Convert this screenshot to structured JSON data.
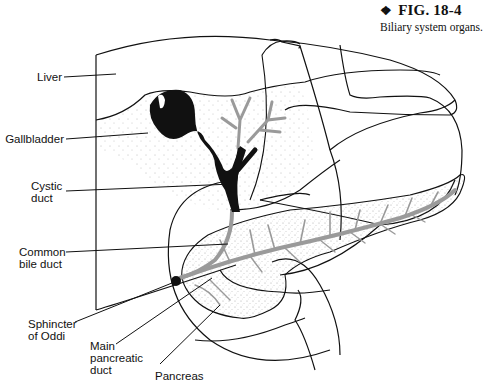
{
  "figure": {
    "bullet": "❖",
    "number": "FIG. 18-4",
    "caption": "Biliary system organs."
  },
  "labels": [
    {
      "id": "liver",
      "text": "Liver"
    },
    {
      "id": "gallbladder",
      "text": "Gallbladder"
    },
    {
      "id": "cystic-duct",
      "text": "Cystic\nduct"
    },
    {
      "id": "common-bile-duct",
      "text": "Common\nbile duct"
    },
    {
      "id": "sphincter-of-oddi",
      "text": "Sphincter\nof Oddi"
    },
    {
      "id": "main-pancreatic-duct",
      "text": "Main\npancreatic\nduct"
    },
    {
      "id": "pancreas",
      "text": "Pancreas"
    }
  ],
  "colors": {
    "ink": "#111111",
    "duct_gray": "#9a9a9a",
    "stipple": "#555555",
    "background": "#ffffff"
  }
}
